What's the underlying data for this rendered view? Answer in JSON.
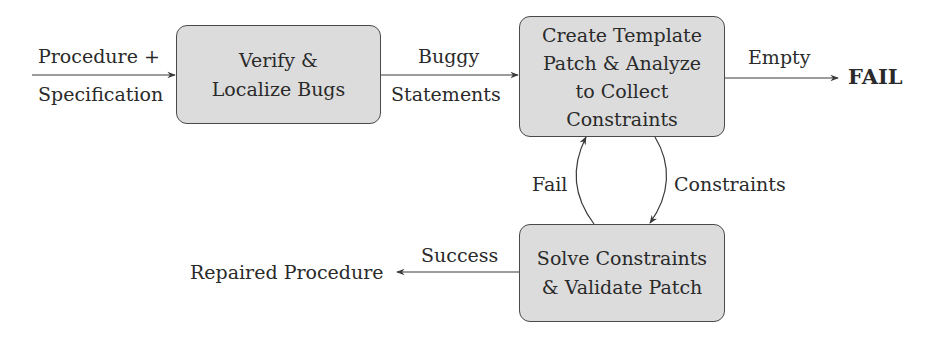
{
  "diagram": {
    "type": "flowchart",
    "nodes": [
      {
        "id": "verify",
        "lines": [
          "Verify &",
          "Localize Bugs"
        ]
      },
      {
        "id": "template",
        "lines": [
          "Create Template",
          "Patch & Analyze",
          "to Collect",
          "Constraints"
        ]
      },
      {
        "id": "solve",
        "lines": [
          "Solve Constraints",
          "& Validate Patch"
        ]
      }
    ],
    "input": {
      "top": "Procedure +",
      "bottom": "Specification"
    },
    "edges": {
      "verify_to_template": {
        "top": "Buggy",
        "bottom": "Statements"
      },
      "template_to_fail": {
        "label": "Empty"
      },
      "solve_to_template": {
        "label": "Fail"
      },
      "template_to_solve": {
        "label": "Constraints"
      },
      "solve_to_output": {
        "label": "Success"
      }
    },
    "terminals": {
      "fail": "FAIL",
      "output": "Repaired Procedure"
    },
    "colors": {
      "box_fill": "#dcdcdc",
      "stroke": "#4a4a4a",
      "text": "#2a2a2a"
    }
  }
}
